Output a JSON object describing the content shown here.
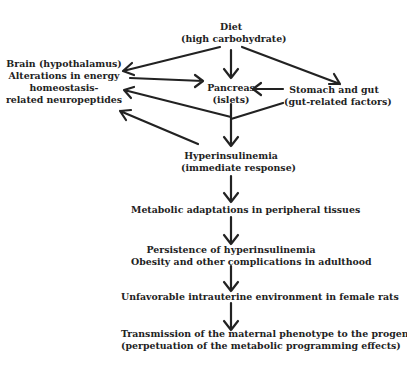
{
  "diagram": {
    "nodes": {
      "diet": {
        "line1": "Diet",
        "line2": "(high carbohydrate)"
      },
      "brain": {
        "line1": "Brain (hypothalamus)",
        "line2": "Alterations in energy",
        "line3": "homeostasis-",
        "line4": "related neuropeptides"
      },
      "pancreas": {
        "line1": "Pancreas",
        "line2": "(islets)"
      },
      "stomach": {
        "line1": "Stomach and gut",
        "line2": "(gut-related factors)"
      },
      "hyperinsulinemia": {
        "line1": "Hyperinsulinemia",
        "line2": "(immediate response)"
      },
      "metabolic": {
        "line1": "Metabolic adaptations in peripheral tissues"
      },
      "persistence": {
        "line1": "Persistence of hyperinsulinemia",
        "line2": "Obesity and other complications in adulthood"
      },
      "intrauterine": {
        "line1": "Unfavorable intrauterine environment in female rats"
      },
      "transmission": {
        "line1": "Transmission of the maternal phenotype to the progeny",
        "line2": "(perpetuation of the metabolic programming effects)"
      }
    },
    "edges": [
      [
        "diet",
        "brain"
      ],
      [
        "diet",
        "pancreas"
      ],
      [
        "diet",
        "stomach"
      ],
      [
        "brain",
        "pancreas"
      ],
      [
        "stomach",
        "pancreas"
      ],
      [
        "pancreas",
        "hyperinsulinemia"
      ],
      [
        "stomach",
        "hyperinsulinemia"
      ],
      [
        "hyperinsulinemia",
        "brain"
      ],
      [
        "hyperinsulinemia",
        "metabolic"
      ],
      [
        "metabolic",
        "persistence"
      ],
      [
        "persistence",
        "intrauterine"
      ],
      [
        "intrauterine",
        "transmission"
      ]
    ],
    "line_color": "#222222"
  }
}
